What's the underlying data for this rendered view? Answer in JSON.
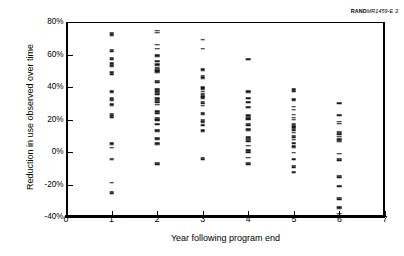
{
  "report_id": {
    "brand": "RAND",
    "number": "MR1459-",
    "figure": "E.3"
  },
  "chart_data": {
    "type": "scatter",
    "title": "",
    "xlabel": "Year following program end",
    "ylabel": "Reduction in use observed over time",
    "xlim": [
      0,
      7
    ],
    "ylim": [
      -40,
      80
    ],
    "xticks": [
      0,
      1,
      2,
      3,
      4,
      5,
      6,
      7
    ],
    "xtick_labels": [
      "0",
      "1",
      "2",
      "3",
      "4",
      "5",
      "6",
      "7"
    ],
    "yticks": [
      -40,
      -20,
      0,
      20,
      40,
      60,
      80
    ],
    "ytick_labels": [
      "-40%",
      "-20%",
      "0%",
      "20%",
      "40%",
      "60%",
      "80%"
    ],
    "grid": false,
    "legend": null,
    "marker_style": "horizontal-dash",
    "series": [
      {
        "name": "Year 1",
        "x": 1,
        "values": [
          73.5,
          72.5,
          71.5,
          63.0,
          62.0,
          58.0,
          57.0,
          54.5,
          53.5,
          52.5,
          49.0,
          48.0,
          37.5,
          36.5,
          33.5,
          32.5,
          31.5,
          29.5,
          28.5,
          23.5,
          22.5,
          21.5,
          5.5,
          4.5,
          2.5,
          -4.0,
          -4.8,
          -19.0,
          -24.5,
          -25.5
        ]
      },
      {
        "name": "Year 2",
        "x": 2,
        "values": [
          74.5,
          73.5,
          66.0,
          63.5,
          59.5,
          58.5,
          56.0,
          54.0,
          53.0,
          52.0,
          51.2,
          50.4,
          49.6,
          48.8,
          44.0,
          43.0,
          38.5,
          37.5,
          36.5,
          35.5,
          33.0,
          32.2,
          31.4,
          30.6,
          29.0,
          25.0,
          24.0,
          21.0,
          20.2,
          19.4,
          17.0,
          13.5,
          12.5,
          8.5,
          7.5,
          5.5,
          4.5,
          -6.5,
          -7.5
        ]
      },
      {
        "name": "Year 3",
        "x": 3,
        "values": [
          69.0,
          63.5,
          51.0,
          50.0,
          47.0,
          46.0,
          45.0,
          40.0,
          39.2,
          38.4,
          37.0,
          36.0,
          35.2,
          34.4,
          33.6,
          32.8,
          31.0,
          30.0,
          28.5,
          24.0,
          23.0,
          20.0,
          19.0,
          18.0,
          16.5,
          13.5,
          12.5,
          -3.5,
          -4.5
        ]
      },
      {
        "name": "Year 4",
        "x": 4,
        "values": [
          57.0,
          37.5,
          36.5,
          33.0,
          30.5,
          27.5,
          22.5,
          21.7,
          20.9,
          20.1,
          17.5,
          16.5,
          14.0,
          13.0,
          9.0,
          8.2,
          7.4,
          6.6,
          4.0,
          1.0,
          0.0,
          -3.5,
          -6.5,
          -7.5
        ]
      },
      {
        "name": "Year 5",
        "x": 5,
        "values": [
          38.5,
          37.5,
          32.5,
          31.5,
          28.0,
          26.0,
          23.0,
          21.0,
          20.0,
          17.5,
          16.7,
          15.9,
          15.1,
          14.3,
          13.5,
          12.0,
          10.0,
          9.0,
          7.5,
          5.5,
          3.5,
          2.5,
          -0.5,
          -4.5,
          -8.5,
          -9.5,
          -12.5
        ]
      },
      {
        "name": "Year 6",
        "x": 6,
        "values": [
          30.0,
          22.5,
          18.5,
          17.5,
          12.5,
          11.7,
          10.9,
          9.5,
          8.0,
          7.0,
          6.2,
          -1.0,
          -4.0,
          -5.0,
          -14.5,
          -15.5,
          -21.0,
          -28.0,
          -29.0,
          -34.0,
          -35.0,
          -38.0
        ]
      }
    ]
  }
}
